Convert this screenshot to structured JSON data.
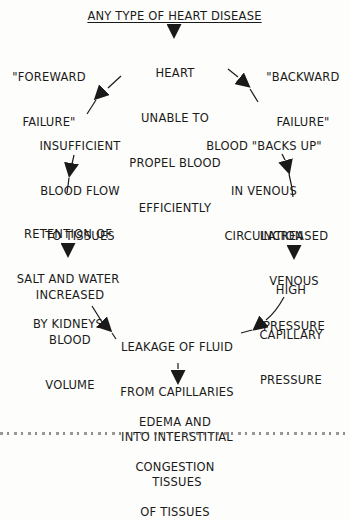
{
  "title": "ANY TYPE OF HEART DISEASE",
  "side_labels": {
    "left": [
      "\"FOREWARD",
      "FAILURE\""
    ],
    "right": [
      "\"BACKWARD",
      "FAILURE\""
    ]
  },
  "nodes": {
    "heart": [
      "HEART",
      "UNABLE TO",
      "PROPEL BLOOD",
      "EFFICIENTLY"
    ],
    "insufficient": [
      "INSUFFICIENT",
      "BLOOD FLOW",
      "TO TISSUES"
    ],
    "retention": [
      "RETENTION OF",
      "SALT AND WATER",
      "BY KIDNEYS"
    ],
    "blood_volume": [
      "INCREASED",
      "BLOOD",
      "VOLUME"
    ],
    "backs_up": [
      "BLOOD \"BACKS UP\"",
      "IN VENOUS",
      "CIRCULATION"
    ],
    "venous_pressure": [
      "INCREASED",
      "VENOUS",
      "PRESSURE"
    ],
    "capillary_pressure": [
      "HIGH",
      "CAPILLARY",
      "PRESSURE"
    ],
    "leakage": [
      "LEAKAGE OF FLUID",
      "FROM CAPILLARIES",
      "INTO INTERSTITIAL",
      "TISSUES"
    ],
    "edema": [
      "EDEMA AND",
      "CONGESTION",
      "OF TISSUES"
    ]
  },
  "edges": [
    {
      "from": "title",
      "to": "heart"
    },
    {
      "from": "heart",
      "to": "insufficient"
    },
    {
      "from": "heart",
      "to": "backs_up"
    },
    {
      "from": "insufficient",
      "to": "retention"
    },
    {
      "from": "retention",
      "to": "blood_volume"
    },
    {
      "from": "blood_volume",
      "to": "leakage"
    },
    {
      "from": "backs_up",
      "to": "venous_pressure"
    },
    {
      "from": "venous_pressure",
      "to": "capillary_pressure"
    },
    {
      "from": "capillary_pressure",
      "to": "leakage"
    },
    {
      "from": "leakage",
      "to": "edema"
    }
  ]
}
